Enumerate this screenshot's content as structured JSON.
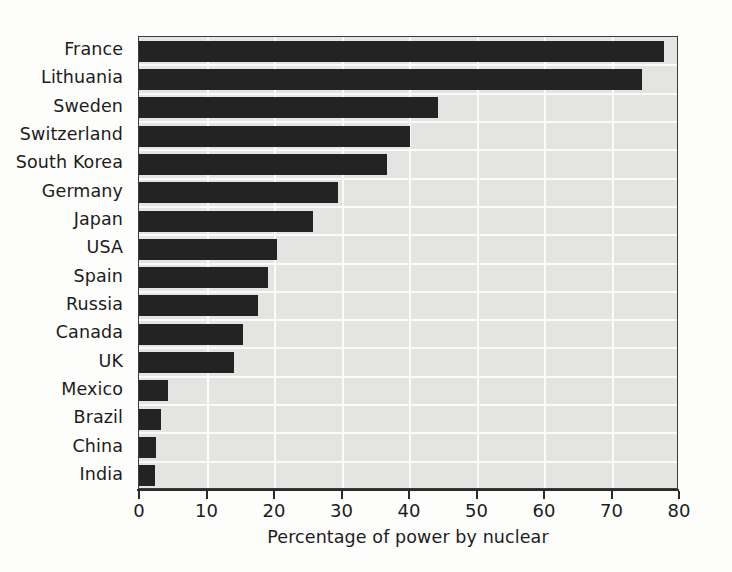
{
  "chart_data": {
    "type": "bar",
    "orientation": "horizontal",
    "title": "",
    "xlabel": "Percentage of power by nuclear",
    "ylabel": "",
    "xlim": [
      0,
      80
    ],
    "xticks": [
      0,
      10,
      20,
      30,
      40,
      50,
      60,
      70,
      80
    ],
    "xticklabels": [
      "0",
      "10",
      "20",
      "30",
      "40",
      "50",
      "60",
      "70",
      "80"
    ],
    "grid": "white gridlines, vertical at each xtick and horizontal between bars",
    "legend": "none",
    "categories": [
      "France",
      "Lithuania",
      "Sweden",
      "Switzerland",
      "South Korea",
      "Germany",
      "Japan",
      "USA",
      "Spain",
      "Russia",
      "Canada",
      "UK",
      "Mexico",
      "Brazil",
      "China",
      "India"
    ],
    "values": [
      77.8,
      74.5,
      44.3,
      40.2,
      36.7,
      29.5,
      25.8,
      20.4,
      19.1,
      17.6,
      15.4,
      14.0,
      4.3,
      3.3,
      2.5,
      2.4
    ],
    "colors": {
      "bar": "#232323",
      "plot_background": "#e4e4e2",
      "gridline": "#fbfbfa",
      "axis": "#2b2b2b",
      "text": "#1c1c1c",
      "figure_background": "#fdfdfc"
    }
  }
}
